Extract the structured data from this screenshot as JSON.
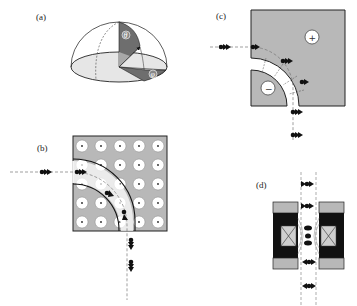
{
  "figure": {
    "panels": [
      {
        "id": "a",
        "label": "(a)",
        "description": "hemisphere with polar angle theta and azimuthal angle phi",
        "symbols": {
          "theta": "θ",
          "phi": "φ"
        }
      },
      {
        "id": "b",
        "label": "(b)",
        "description": "5x5 array of circular rods with curved waveguide bend",
        "grid": {
          "rows": 5,
          "cols": 5
        }
      },
      {
        "id": "c",
        "label": "(c)",
        "description": "curved channel between charged electrodes",
        "electrodes": {
          "outer": "+",
          "inner": "−"
        }
      },
      {
        "id": "d",
        "label": "(d)",
        "description": "magnetic lens cross-section with focused particles"
      }
    ],
    "colors": {
      "fill_gray": "#b8b8b8",
      "dark": "#111111",
      "ellipse_fill": "#e6e6e6",
      "theta_fill": "#6e6e6e",
      "light_gray": "#c8c8c8"
    }
  }
}
